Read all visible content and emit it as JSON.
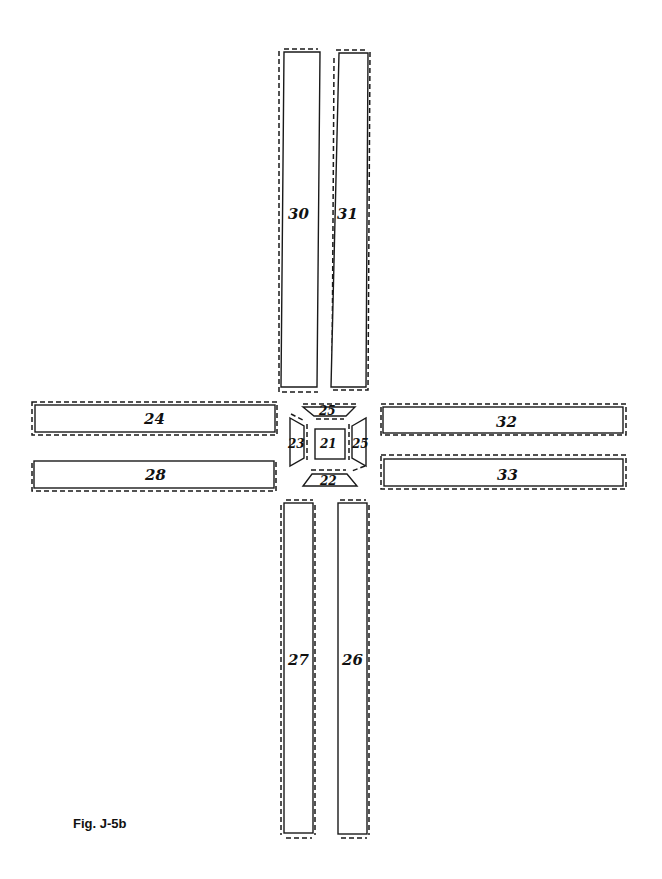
{
  "figure": {
    "caption": "Fig. J-5b",
    "pieces": [
      {
        "id": "21",
        "label": "21",
        "shape": "square",
        "position": "center"
      },
      {
        "id": "22",
        "label": "22",
        "shape": "trapezoid",
        "position": "below-center"
      },
      {
        "id": "23",
        "label": "23",
        "shape": "trapezoid",
        "position": "left-center"
      },
      {
        "id": "24",
        "label": "24",
        "shape": "trapezoid",
        "position": "above-center"
      },
      {
        "id": "25",
        "label": "25",
        "shape": "trapezoid",
        "position": "right-center"
      },
      {
        "id": "26",
        "label": "26",
        "shape": "vertical-strip",
        "position": "bottom-right"
      },
      {
        "id": "27",
        "label": "27",
        "shape": "vertical-strip",
        "position": "bottom-left"
      },
      {
        "id": "28",
        "label": "28",
        "shape": "horizontal-strip",
        "position": "left-bottom"
      },
      {
        "id": "29",
        "label": "29",
        "shape": "horizontal-strip",
        "position": "left-top"
      },
      {
        "id": "30",
        "label": "30",
        "shape": "vertical-strip",
        "position": "top-left"
      },
      {
        "id": "31",
        "label": "31",
        "shape": "vertical-strip",
        "position": "top-right"
      },
      {
        "id": "32",
        "label": "32",
        "shape": "horizontal-strip",
        "position": "right-top"
      },
      {
        "id": "33",
        "label": "33",
        "shape": "horizontal-strip",
        "position": "right-bottom"
      }
    ]
  }
}
